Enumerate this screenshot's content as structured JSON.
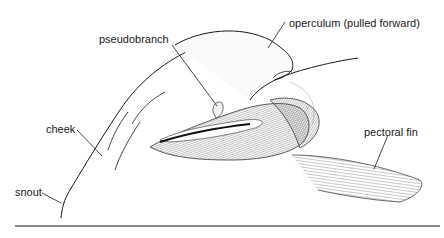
{
  "figure": {
    "labels": {
      "pseudobranch": "pseudobranch",
      "operculum": "operculum (pulled forward)",
      "cheek": "cheek",
      "snout": "snout",
      "pectoral_fin": "pectoral fin"
    },
    "colors": {
      "ink": "#1a1a1a",
      "shading": "#888888",
      "background": "#ffffff",
      "rule": "#666666"
    }
  }
}
